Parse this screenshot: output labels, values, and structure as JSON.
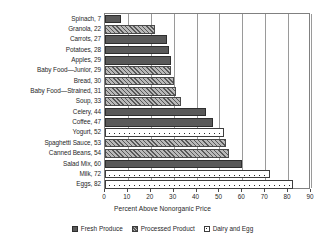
{
  "chart_data": {
    "type": "bar",
    "orientation": "horizontal",
    "title": "",
    "xlabel": "Percent Above Nonorganic Price",
    "ylabel": "",
    "xlim": [
      0,
      90
    ],
    "xticks": [
      0,
      10,
      20,
      30,
      40,
      50,
      60,
      70,
      80,
      90
    ],
    "xtick_labels": [
      "0",
      "10",
      "20",
      "30",
      "40",
      "50",
      "60",
      "70",
      "80",
      "90"
    ],
    "grid": "vertical",
    "legend_position": "bottom",
    "categories": [
      "Spinach",
      "Granola",
      "Carrots",
      "Potatoes",
      "Apples",
      "Baby Food—Junior",
      "Bread",
      "Baby Food—Strained",
      "Soup",
      "Celery",
      "Coffee",
      "Yogurt",
      "Spaghetti Sauce",
      "Canned Beans",
      "Salad Mix",
      "Milk",
      "Eggs"
    ],
    "values": [
      7,
      22,
      27,
      28,
      29,
      29,
      30,
      31,
      33,
      44,
      47,
      52,
      53,
      54,
      60,
      72,
      82
    ],
    "tick_labels": [
      "Spinach, 7",
      "Granola, 22",
      "Carrots, 27",
      "Potatoes, 28",
      "Apples, 29",
      "Baby Food—Junior, 29",
      "Bread, 30",
      "Baby Food—Strained, 31",
      "Soup, 33",
      "Celery, 44",
      "Coffee, 47",
      "Yogurt, 52",
      "Spaghetti Sauce, 53",
      "Canned Beans, 54",
      "Salad Mix, 60",
      "Milk, 72",
      "Eggs, 82"
    ],
    "group_of_each_bar": [
      "fresh",
      "processed",
      "fresh",
      "fresh",
      "fresh",
      "processed",
      "processed",
      "processed",
      "processed",
      "fresh",
      "fresh",
      "dairy",
      "processed",
      "processed",
      "fresh",
      "dairy",
      "dairy"
    ],
    "legend": [
      {
        "key": "fresh",
        "label": "Fresh Produce"
      },
      {
        "key": "processed",
        "label": "Processed Product"
      },
      {
        "key": "dairy",
        "label": "Dairy and Egg"
      }
    ],
    "colors": {
      "fresh": "#595959",
      "processed": "#b9b9b9",
      "dairy": "#ffffff",
      "axis": "#808080",
      "grid": "#9a9a9a",
      "text": "#1f1f1f"
    }
  }
}
